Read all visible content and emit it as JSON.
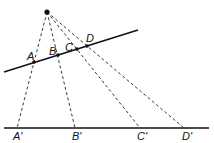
{
  "diagram": {
    "type": "central projection",
    "apex": {
      "x": 47,
      "y": 12
    },
    "upper_line": {
      "x1": 4,
      "y1": 72,
      "x2": 138,
      "y2": 30
    },
    "lower_line": {
      "x1": 4,
      "y1": 128,
      "x2": 209,
      "y2": 128
    },
    "points": [
      {
        "label": "A",
        "x": 34,
        "y": 62,
        "lx": 27,
        "ly": 60,
        "proj_label": "A'",
        "px": 17,
        "plx": 13
      },
      {
        "label": "B",
        "x": 58,
        "y": 55,
        "lx": 49,
        "ly": 55,
        "proj_label": "B'",
        "px": 75,
        "plx": 72
      },
      {
        "label": "C",
        "x": 77,
        "y": 49,
        "lx": 65,
        "ly": 51,
        "proj_label": "C'",
        "px": 140,
        "plx": 137
      },
      {
        "label": "D",
        "x": 87,
        "y": 46,
        "lx": 86,
        "ly": 42,
        "proj_label": "D'",
        "px": 184,
        "plx": 182
      }
    ],
    "colors": {
      "line": "#111111",
      "background": "#ffffff"
    }
  }
}
